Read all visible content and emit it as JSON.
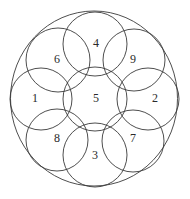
{
  "diagram": {
    "width": 190,
    "height": 199,
    "stroke_color": "#3a3a3a",
    "outer_circle": {
      "cx": 94,
      "cy": 98.5,
      "rx": 83.5,
      "ry": 87.5
    },
    "circles": [
      {
        "id": "1",
        "label": "1",
        "cx": 41,
        "cy": 99,
        "r": 31,
        "label_x": 35,
        "label_y": 98
      },
      {
        "id": "2",
        "label": "2",
        "cx": 148,
        "cy": 99,
        "r": 31,
        "label_x": 155,
        "label_y": 98
      },
      {
        "id": "3",
        "label": "3",
        "cx": 95,
        "cy": 155,
        "r": 32,
        "label_x": 95,
        "label_y": 155
      },
      {
        "id": "4",
        "label": "4",
        "cx": 95,
        "cy": 44,
        "r": 32,
        "label_x": 96,
        "label_y": 43
      },
      {
        "id": "5",
        "label": "5",
        "cx": 95,
        "cy": 99,
        "r": 32,
        "label_x": 96,
        "label_y": 98
      },
      {
        "id": "6",
        "label": "6",
        "cx": 58,
        "cy": 60,
        "r": 32,
        "label_x": 57,
        "label_y": 59
      },
      {
        "id": "7",
        "label": "7",
        "cx": 133,
        "cy": 141,
        "r": 31,
        "label_x": 133,
        "label_y": 138
      },
      {
        "id": "8",
        "label": "8",
        "cx": 57,
        "cy": 140,
        "r": 31,
        "label_x": 57,
        "label_y": 138
      },
      {
        "id": "9",
        "label": "9",
        "cx": 134,
        "cy": 60,
        "r": 31,
        "label_x": 133,
        "label_y": 59
      }
    ]
  }
}
